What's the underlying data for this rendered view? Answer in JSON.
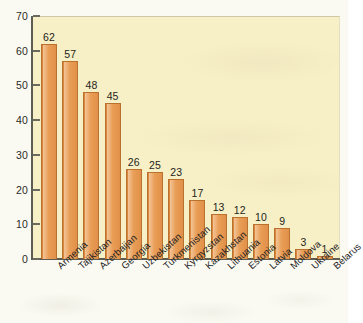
{
  "chart_data": {
    "type": "bar",
    "title": "",
    "subtitle": "",
    "xlabel": "",
    "ylabel": "",
    "ylim": [
      0,
      70
    ],
    "y_ticks": [
      0,
      10,
      20,
      30,
      40,
      50,
      60,
      70
    ],
    "grid": false,
    "legend": null,
    "orientation": "vertical",
    "bar_color": "#e79a52",
    "bar_edge_color": "#b9712f",
    "plot_background": "#f7efc6",
    "figure_background": "#fbfaf2",
    "axis_color": "#5d5c53",
    "categories": [
      "Armenia",
      "Tajikistan",
      "Azerbaijan",
      "Georgia",
      "Uzbekistan",
      "Turkmenistan",
      "Kyrgyzstan",
      "Kazakhstan",
      "Lithuania",
      "Estonia",
      "Latvia",
      "Moldova",
      "Ukraine",
      "Belarus"
    ],
    "values": [
      62,
      57,
      48,
      45,
      26,
      25,
      23,
      17,
      13,
      12,
      10,
      9,
      3,
      1
    ],
    "data_labels": [
      "62",
      "57",
      "48",
      "45",
      "26",
      "25",
      "23",
      "17",
      "13",
      "12",
      "10",
      "9",
      "3",
      "1"
    ],
    "tick_labels": [
      "0",
      "10",
      "20",
      "30",
      "40",
      "50",
      "60",
      "70"
    ]
  }
}
